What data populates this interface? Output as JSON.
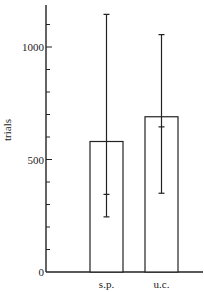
{
  "chart_data": {
    "type": "bar",
    "title": "",
    "xlabel": "",
    "ylabel": "trials",
    "categories": [
      "s.p.",
      "u.c."
    ],
    "values": [
      580,
      690
    ],
    "error_bars": [
      {
        "category": "s.p.",
        "upper": 1145,
        "lower": 245,
        "inner_tick": 345
      },
      {
        "category": "u.c.",
        "upper": 1055,
        "lower": 350,
        "inner_tick": 645
      }
    ],
    "ylim": [
      0,
      1180
    ],
    "yticks_major": [
      0,
      500,
      1000
    ],
    "ytick_labels": [
      "0",
      "500",
      "1000"
    ],
    "yticks_minor_step": 100,
    "grid": false,
    "legend": null,
    "colors": {
      "bar_fill": "#ffffff",
      "stroke": "#222222"
    }
  }
}
